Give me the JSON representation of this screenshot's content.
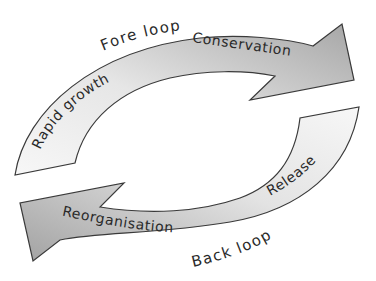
{
  "diagram": {
    "type": "adaptive-cycle",
    "colors": {
      "outline": "#3a3a3a",
      "dark_fill": "#a8a8a8",
      "light_fill": "#f2f2f2",
      "text": "#2a2a2a",
      "background": "#ffffff"
    },
    "loops": {
      "fore": {
        "label": "Fore loop",
        "phases": [
          "Rapid growth",
          "Conservation"
        ]
      },
      "back": {
        "label": "Back loop",
        "phases": [
          "Release",
          "Reorganisation"
        ]
      }
    },
    "labels": {
      "fore_loop": "Fore loop",
      "back_loop": "Back loop",
      "rapid_growth": "Rapid growth",
      "conservation": "Conservation",
      "release": "Release",
      "reorganisation": "Reorganisation"
    }
  }
}
